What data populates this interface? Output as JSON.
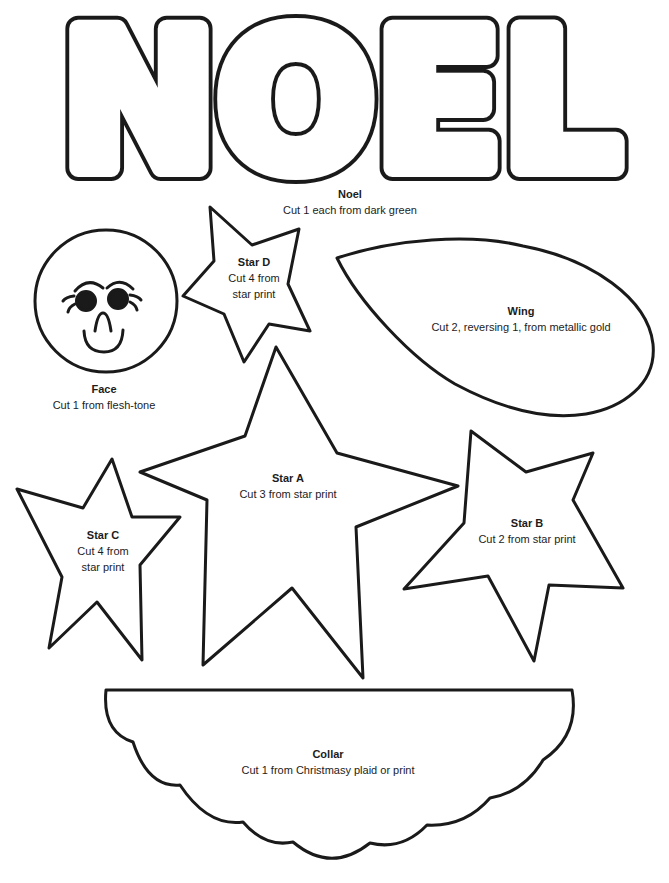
{
  "page_type": "craft-pattern-template",
  "title_word": "NOEL",
  "colors": {
    "ink": "#1a1a1a",
    "paper": "#ffffff"
  },
  "labels": {
    "noel": {
      "name": "Noel",
      "line1": "Cut 1 each from dark green"
    },
    "star_d": {
      "name": "Star D",
      "line1": "Cut 4 from",
      "line2": "star print"
    },
    "wing": {
      "name": "Wing",
      "line1": "Cut 2, reversing 1, from metallic gold"
    },
    "face": {
      "name": "Face",
      "line1": "Cut 1 from flesh-tone"
    },
    "star_a": {
      "name": "Star A",
      "line1": "Cut 3 from star print"
    },
    "star_b": {
      "name": "Star B",
      "line1": "Cut 2 from star print"
    },
    "star_c": {
      "name": "Star C",
      "line1": "Cut 4 from",
      "line2": "star print"
    },
    "collar": {
      "name": "Collar",
      "line1": "Cut 1 from Christmasy plaid or print"
    }
  }
}
